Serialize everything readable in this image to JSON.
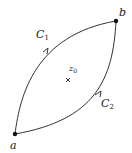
{
  "diagram": {
    "points": {
      "a": {
        "label": "a",
        "x": 15,
        "y": 134
      },
      "b": {
        "label": "b",
        "x": 116,
        "y": 21
      }
    },
    "contours": [
      {
        "name": "C1",
        "label": "C",
        "subscript": "1",
        "direction": "a-to-b"
      },
      {
        "name": "C2",
        "label": "C",
        "subscript": "2",
        "direction": "a-to-b"
      }
    ],
    "interior_point": {
      "label": "z",
      "subscript": "0",
      "marker": "×"
    },
    "colors": {
      "stroke": "#333333",
      "text": "#222222"
    }
  }
}
